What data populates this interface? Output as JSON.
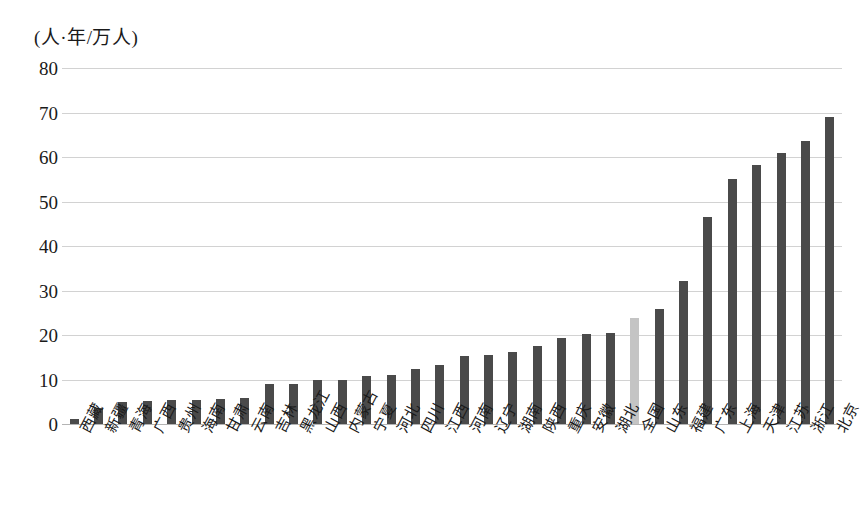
{
  "chart_data": {
    "type": "bar",
    "title": "",
    "subtitle": "",
    "xlabel": "",
    "ylabel": "(人·年/万人)",
    "ylim": [
      0,
      80
    ],
    "ytick_step": 10,
    "yticks": [
      "80",
      "70",
      "60",
      "50",
      "40",
      "30",
      "20",
      "10",
      "0"
    ],
    "grid": true,
    "legend": "none",
    "bar_color": "#4a4a4a",
    "highlight_color": "#c4c4c4",
    "highlight_category": "全国",
    "categories": [
      "西藏",
      "新疆",
      "青海",
      "广西",
      "贵州",
      "海南",
      "甘肃",
      "云南",
      "吉林",
      "黑龙江",
      "山西",
      "内蒙古",
      "宁夏",
      "河北",
      "四川",
      "江西",
      "河南",
      "辽宁",
      "湖南",
      "陕西",
      "重庆",
      "安徽",
      "湖北",
      "全国",
      "山东",
      "福建",
      "广东",
      "上海",
      "天津",
      "江苏",
      "浙江",
      "北京"
    ],
    "values": [
      1.2,
      3.5,
      4.9,
      5.1,
      5.3,
      5.5,
      5.7,
      5.9,
      9.0,
      9.1,
      9.8,
      10.0,
      10.9,
      11.1,
      12.3,
      13.2,
      15.2,
      15.5,
      16.2,
      17.6,
      19.4,
      20.2,
      20.4,
      23.8,
      25.8,
      32.2,
      46.6,
      55.0,
      58.2,
      60.9,
      63.5,
      69.0
    ]
  }
}
